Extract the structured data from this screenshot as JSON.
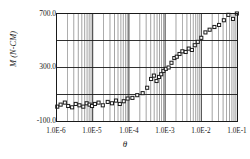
{
  "chart_data": {
    "type": "scatter",
    "title": "",
    "subtitle": "",
    "xlabel": "θ",
    "ylabel": "M (N-CM)",
    "xscale": "log",
    "yscale": "linear",
    "xlim": [
      1e-06,
      0.1
    ],
    "ylim": [
      -100.0,
      700.0
    ],
    "grid": true,
    "grid_minor_x": true,
    "legend": "none",
    "marker": "open-square",
    "xticklabels": [
      "1.0E-6",
      "1.0E-5",
      "1.0E-4",
      "1.0E-3",
      "1.0E-2",
      "1.0E-1"
    ],
    "xtickvalues": [
      1e-06,
      1e-05,
      0.0001,
      0.001,
      0.01,
      0.1
    ],
    "yticklabels": [
      "700.0",
      "300.0",
      "-100.0"
    ],
    "ytickvalues": [
      700.0,
      300.0,
      -100.0
    ],
    "ygridlines": [
      700.0,
      500.0,
      300.0,
      100.0,
      -100.0
    ],
    "series": [
      {
        "name": "M",
        "x": [
          1.05e-06,
          1.3e-06,
          1.7e-06,
          2.1e-06,
          2.7e-06,
          3.4e-06,
          4.3e-06,
          5.5e-06,
          6.8e-06,
          8.2e-06,
          9.6e-06,
          1.15e-05,
          1.45e-05,
          1.9e-05,
          2.6e-05,
          3.4e-05,
          4.4e-05,
          5.6e-05,
          7.2e-05,
          9.2e-05,
          0.000125,
          0.00017,
          0.00024,
          0.00032,
          0.00041,
          0.00049,
          0.00058,
          0.00068,
          0.00078,
          0.0009,
          0.00105,
          0.00125,
          0.0015,
          0.0018,
          0.0021,
          0.0025,
          0.003,
          0.0037,
          0.0045,
          0.0055,
          0.0066,
          0.008,
          0.01,
          0.013,
          0.017,
          0.023,
          0.031,
          0.042,
          0.056,
          0.075,
          0.096
        ],
        "y": [
          10,
          25,
          40,
          15,
          5,
          30,
          20,
          10,
          35,
          25,
          15,
          30,
          40,
          20,
          45,
          35,
          55,
          30,
          50,
          70,
          75,
          95,
          110,
          150,
          215,
          240,
          200,
          230,
          250,
          275,
          290,
          300,
          335,
          370,
          380,
          400,
          420,
          415,
          440,
          430,
          465,
          490,
          520,
          560,
          580,
          600,
          615,
          650,
          690,
          660,
          700
        ]
      }
    ]
  },
  "axes": {
    "frame_color": "#1a1a1a",
    "grid_color": "#666666",
    "marker_edge_color": "#1a1a1a",
    "marker_face_color": "#ffffff",
    "background": "#ffffff"
  }
}
